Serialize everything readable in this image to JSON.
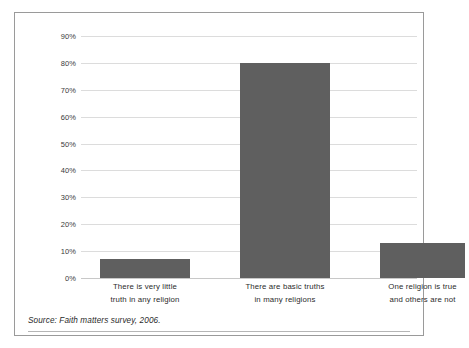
{
  "chart_data": {
    "type": "bar",
    "title": "",
    "subtitle": "",
    "xlabel": "",
    "ylabel": "",
    "ylim": [
      0,
      90
    ],
    "ytick_step": 10,
    "grid": true,
    "legend": null,
    "bar_color": "#5f5f5f",
    "gridline_color": "#dcdcdc",
    "categories": [
      "There is very little truth in any religion",
      "There are basic truths in many religions",
      "One religion is true and others are not"
    ],
    "category_lines": [
      [
        "There is very little",
        "truth in any religion"
      ],
      [
        "There are basic truths",
        "in many religions"
      ],
      [
        "One religion is true",
        "and others are not"
      ]
    ],
    "values": [
      7,
      80,
      13
    ],
    "ytick_labels": [
      "90%",
      "80%",
      "70%",
      "60%",
      "50%",
      "40%",
      "30%",
      "20%",
      "10%",
      "0%"
    ],
    "ytick_values": [
      90,
      80,
      70,
      60,
      50,
      40,
      30,
      20,
      10,
      0
    ]
  },
  "source": {
    "note": "Source: Faith matters survey, 2006."
  }
}
